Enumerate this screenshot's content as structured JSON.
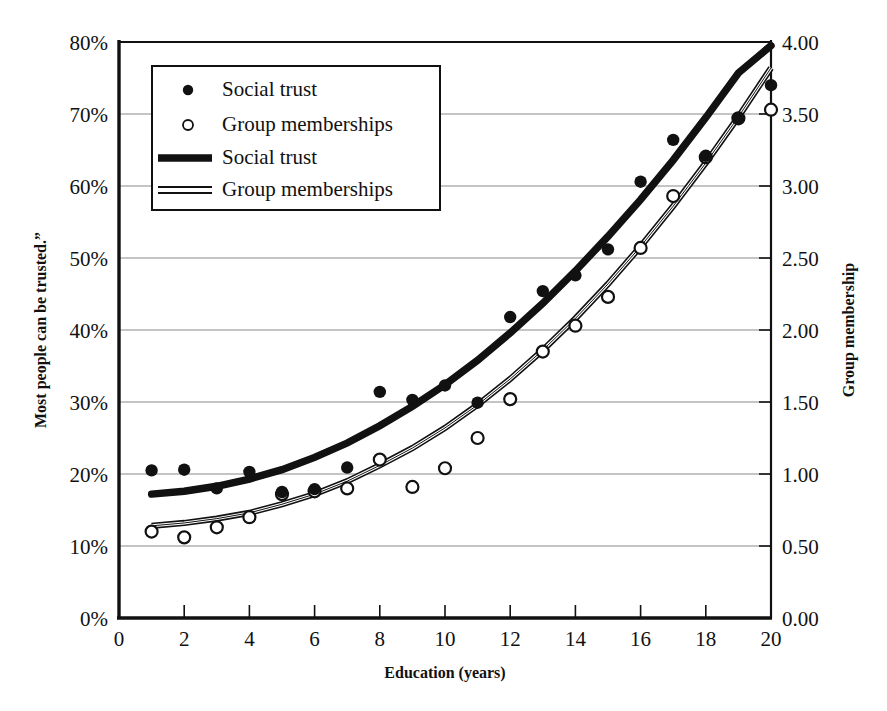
{
  "chart_data": {
    "type": "scatter",
    "title": "",
    "subtitle": "",
    "xlabel": "Education (years)",
    "ylabel": "Most  people can be trusted.”",
    "y2label": "Group membership",
    "xlim": [
      0,
      20
    ],
    "ylim": [
      0,
      0.8
    ],
    "y2lim": [
      0.0,
      4.0
    ],
    "grid": "horizontal",
    "legend_position": "top-left-inside",
    "xticks": [
      0,
      2,
      4,
      6,
      8,
      10,
      12,
      14,
      16,
      18,
      20
    ],
    "xtick_labels": [
      "0",
      "2",
      "4",
      "6",
      "8",
      "10",
      "12",
      "14",
      "16",
      "18",
      "20"
    ],
    "yticks": [
      0,
      0.1,
      0.2,
      0.3,
      0.4,
      0.5,
      0.6,
      0.7,
      0.8
    ],
    "ytick_labels": [
      "0%",
      "10%",
      "20%",
      "30%",
      "40%",
      "50%",
      "60%",
      "70%",
      "80%"
    ],
    "y2ticks": [
      0.0,
      0.5,
      1.0,
      1.5,
      2.0,
      2.5,
      3.0,
      3.5,
      4.0
    ],
    "y2tick_labels": [
      "0.00",
      "0.50",
      "1.00",
      "1.50",
      "2.00",
      "2.50",
      "3.00",
      "3.50",
      "4.00"
    ],
    "x": [
      1,
      2,
      3,
      4,
      5,
      6,
      7,
      8,
      9,
      10,
      11,
      12,
      13,
      14,
      15,
      16,
      17,
      18,
      19,
      20
    ],
    "series": [
      {
        "name": "Social trust",
        "kind": "scatter",
        "marker": "filled-circle",
        "axis": "left",
        "units": "percent",
        "values": [
          20.5,
          20.6,
          18.0,
          20.3,
          17.5,
          17.9,
          20.9,
          31.4,
          30.3,
          32.3,
          29.9,
          41.8,
          45.4,
          47.6,
          51.2,
          60.6,
          66.4,
          64.2,
          69.4,
          74.0
        ]
      },
      {
        "name": "Group memberships",
        "kind": "scatter",
        "marker": "open-circle",
        "axis": "right",
        "units": "groups",
        "values": [
          0.6,
          0.56,
          0.63,
          0.7,
          0.86,
          0.88,
          0.9,
          1.1,
          0.91,
          1.04,
          1.25,
          1.52,
          1.85,
          2.03,
          2.23,
          2.57,
          2.93,
          3.2,
          3.47,
          3.53
        ]
      },
      {
        "name": "Social trust",
        "kind": "fit-line",
        "style": "thick-solid",
        "axis": "left",
        "units": "percent",
        "values": [
          17.2,
          17.6,
          18.3,
          19.3,
          20.6,
          22.3,
          24.3,
          26.7,
          29.4,
          32.4,
          35.8,
          39.6,
          43.7,
          48.2,
          53.0,
          58.1,
          63.6,
          69.5,
          75.7,
          79.5
        ]
      },
      {
        "name": "Group memberships",
        "kind": "fit-line",
        "style": "double-rule",
        "axis": "right",
        "units": "groups",
        "values": [
          0.64,
          0.66,
          0.69,
          0.73,
          0.79,
          0.86,
          0.95,
          1.06,
          1.18,
          1.32,
          1.48,
          1.66,
          1.86,
          2.08,
          2.32,
          2.58,
          2.86,
          3.16,
          3.48,
          3.82
        ]
      }
    ],
    "legend_entries": [
      {
        "label": "Social trust",
        "symbol": "filled-circle"
      },
      {
        "label": "Group memberships",
        "symbol": "open-circle"
      },
      {
        "label": "Social trust",
        "symbol": "thick-line"
      },
      {
        "label": "Group memberships",
        "symbol": "double-line"
      }
    ],
    "colors": {
      "ink": "#111111",
      "grid": "#8a8a8a",
      "axis": "#111111",
      "background": "#ffffff"
    }
  },
  "footer": {
    "caption": ""
  }
}
